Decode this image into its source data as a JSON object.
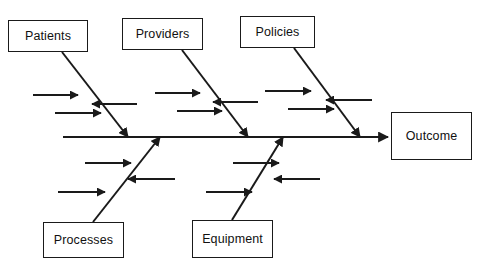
{
  "diagram": {
    "type": "fishbone-ishikawa",
    "background_color": "#ffffff",
    "line_color": "#1a1a1a",
    "text_color": "#111111",
    "spine": {
      "label": "spine",
      "x1": 63,
      "y1": 137,
      "x2": 388,
      "y2": 137
    },
    "effect": {
      "label": "Outcome",
      "box": {
        "x": 391,
        "y": 112,
        "width": 81,
        "height": 48
      }
    },
    "categories": [
      {
        "id": "patients",
        "label": "Patients",
        "side": "top",
        "box": {
          "x": 8,
          "y": 20,
          "width": 80,
          "height": 32
        },
        "bone": {
          "x1": 62,
          "y1": 52,
          "x2": 128,
          "y2": 137
        },
        "sub_causes": [
          {
            "direction": "right",
            "x1": 33,
            "y1": 95,
            "x2": 78,
            "y2": 95
          },
          {
            "direction": "left",
            "x1": 137,
            "y1": 104,
            "x2": 92,
            "y2": 104
          },
          {
            "direction": "right",
            "x1": 55,
            "y1": 113,
            "x2": 101,
            "y2": 113
          }
        ]
      },
      {
        "id": "providers",
        "label": "Providers",
        "side": "top",
        "box": {
          "x": 122,
          "y": 18,
          "width": 81,
          "height": 32
        },
        "bone": {
          "x1": 182,
          "y1": 50,
          "x2": 248,
          "y2": 137
        },
        "sub_causes": [
          {
            "direction": "right",
            "x1": 155,
            "y1": 93,
            "x2": 200,
            "y2": 93
          },
          {
            "direction": "left",
            "x1": 258,
            "y1": 102,
            "x2": 213,
            "y2": 102
          },
          {
            "direction": "right",
            "x1": 177,
            "y1": 111,
            "x2": 222,
            "y2": 111
          }
        ]
      },
      {
        "id": "policies",
        "label": "Policies",
        "side": "top",
        "box": {
          "x": 240,
          "y": 16,
          "width": 75,
          "height": 32
        },
        "bone": {
          "x1": 294,
          "y1": 48,
          "x2": 360,
          "y2": 137
        },
        "sub_causes": [
          {
            "direction": "right",
            "x1": 265,
            "y1": 91,
            "x2": 311,
            "y2": 91
          },
          {
            "direction": "left",
            "x1": 372,
            "y1": 100,
            "x2": 326,
            "y2": 100
          },
          {
            "direction": "right",
            "x1": 288,
            "y1": 109,
            "x2": 334,
            "y2": 109
          }
        ]
      },
      {
        "id": "processes",
        "label": "Processes",
        "side": "bottom",
        "box": {
          "x": 43,
          "y": 222,
          "width": 81,
          "height": 36
        },
        "bone": {
          "x1": 93,
          "y1": 222,
          "x2": 160,
          "y2": 137
        },
        "sub_causes": [
          {
            "direction": "right",
            "x1": 85,
            "y1": 163,
            "x2": 131,
            "y2": 163
          },
          {
            "direction": "left",
            "x1": 175,
            "y1": 179,
            "x2": 128,
            "y2": 179
          },
          {
            "direction": "right",
            "x1": 58,
            "y1": 192,
            "x2": 105,
            "y2": 192
          }
        ]
      },
      {
        "id": "equipment",
        "label": "Equipment",
        "side": "bottom",
        "box": {
          "x": 192,
          "y": 220,
          "width": 81,
          "height": 38
        },
        "bone": {
          "x1": 232,
          "y1": 220,
          "x2": 283,
          "y2": 137
        },
        "sub_causes": [
          {
            "direction": "right",
            "x1": 233,
            "y1": 163,
            "x2": 279,
            "y2": 163
          },
          {
            "direction": "left",
            "x1": 320,
            "y1": 179,
            "x2": 274,
            "y2": 179
          },
          {
            "direction": "right",
            "x1": 206,
            "y1": 192,
            "x2": 252,
            "y2": 192
          }
        ]
      }
    ]
  }
}
